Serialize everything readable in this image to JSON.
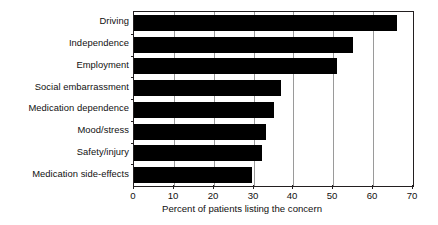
{
  "chart_data": {
    "type": "bar",
    "orientation": "horizontal",
    "title": "",
    "xlabel": "Percent of patients listing the concern",
    "ylabel": "",
    "xlim": [
      0,
      70
    ],
    "xticks": [
      0,
      10,
      20,
      30,
      40,
      50,
      60,
      70
    ],
    "grid": true,
    "grid_axis": "x",
    "legend": null,
    "bar_color": "#000000",
    "categories": [
      "Driving",
      "Independence",
      "Employment",
      "Social embarrassment",
      "Medication dependence",
      "Mood/stress",
      "Safety/injury",
      "Medication side-effects"
    ],
    "values": [
      66,
      55,
      51,
      37,
      35,
      33,
      32,
      29.5
    ],
    "series": [
      {
        "name": "Percent of patients listing the concern",
        "values": [
          66,
          55,
          51,
          37,
          35,
          33,
          32,
          29.5
        ]
      }
    ]
  },
  "axis": {
    "x_tick_labels": [
      "0",
      "10",
      "20",
      "30",
      "40",
      "50",
      "60",
      "70"
    ],
    "x_title": "Percent of patients listing the concern"
  },
  "colors": {
    "bar": "#000000",
    "axis": "#231f20",
    "gridline": "#9a9a9a",
    "background": "#ffffff",
    "text": "#111111"
  }
}
